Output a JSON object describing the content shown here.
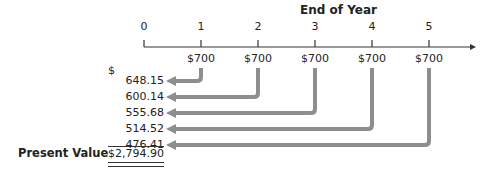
{
  "diagram": {
    "title": "End of Year",
    "periods": [
      "0",
      "1",
      "2",
      "3",
      "4",
      "5"
    ],
    "cash_flows": [
      "$700",
      "$700",
      "$700",
      "$700",
      "$700"
    ],
    "currency_symbol": "$",
    "present_values": [
      "648.15",
      "600.14",
      "555.68",
      "514.52",
      "476.41"
    ],
    "total_label": "Present Value",
    "total_value": "$2,794.90",
    "arrow_color": "#8e8e8e"
  }
}
